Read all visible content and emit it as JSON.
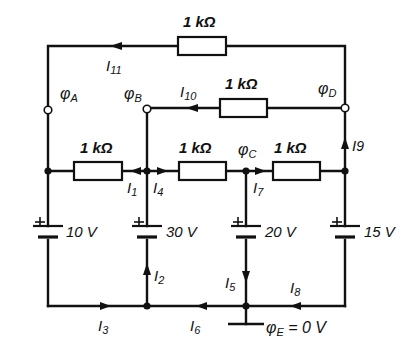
{
  "diagram": {
    "type": "circuit-schematic",
    "line_color": "#111111",
    "background": "#ffffff"
  },
  "resistors": [
    {
      "id": "R_top",
      "label": "1 kΩ",
      "between": "φD → φA (top)"
    },
    {
      "id": "R_DB",
      "label": "1 kΩ",
      "between": "φD → φB"
    },
    {
      "id": "R_1",
      "label": "1 kΩ",
      "between": "left node → φB"
    },
    {
      "id": "R_4",
      "label": "1 kΩ",
      "between": "φB → φC"
    },
    {
      "id": "R_7",
      "label": "1 kΩ",
      "between": "φC → right node"
    }
  ],
  "sources": [
    {
      "id": "U1",
      "label": "10 V"
    },
    {
      "id": "U2",
      "label": "30 V"
    },
    {
      "id": "U3",
      "label": "20 V"
    },
    {
      "id": "U4",
      "label": "15 V"
    }
  ],
  "potentials": {
    "A": {
      "symbol": "φ",
      "sub": "A"
    },
    "B": {
      "symbol": "φ",
      "sub": "B"
    },
    "C": {
      "symbol": "φ",
      "sub": "C"
    },
    "D": {
      "symbol": "φ",
      "sub": "D"
    },
    "E": {
      "symbol": "φ",
      "sub": "E",
      "value": " = 0 V"
    }
  },
  "currents": [
    {
      "symbol": "I",
      "sub": "1"
    },
    {
      "symbol": "I",
      "sub": "2"
    },
    {
      "symbol": "I",
      "sub": "3"
    },
    {
      "symbol": "I",
      "sub": "4"
    },
    {
      "symbol": "I",
      "sub": "5"
    },
    {
      "symbol": "I",
      "sub": "6"
    },
    {
      "symbol": "I",
      "sub": "7"
    },
    {
      "symbol": "I",
      "sub": "8"
    },
    {
      "symbol": "I",
      "sub": "9"
    },
    {
      "symbol": "I",
      "sub": "10"
    },
    {
      "symbol": "I",
      "sub": "11"
    }
  ]
}
